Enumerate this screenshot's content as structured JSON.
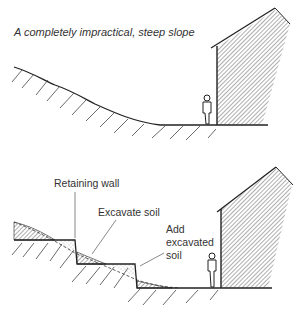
{
  "figure": {
    "top_panel": {
      "title": "A completely impractical, steep slope",
      "elements": [
        "steep-slope-ground",
        "person",
        "house"
      ]
    },
    "bottom_panel": {
      "labels": {
        "retaining_wall": "Retaining wall",
        "excavate_soil": "Excavate soil",
        "add_excavated_soil_line1": "Add",
        "add_excavated_soil_line2": "excavated",
        "add_excavated_soil_line3": "soil"
      },
      "elements": [
        "terraced-ground",
        "retaining-walls",
        "excavated-soil-hatch",
        "fill-soil-stipple",
        "person",
        "house"
      ]
    },
    "colors": {
      "ink": "#222222",
      "label_text": "#333333",
      "background": "#ffffff"
    }
  }
}
